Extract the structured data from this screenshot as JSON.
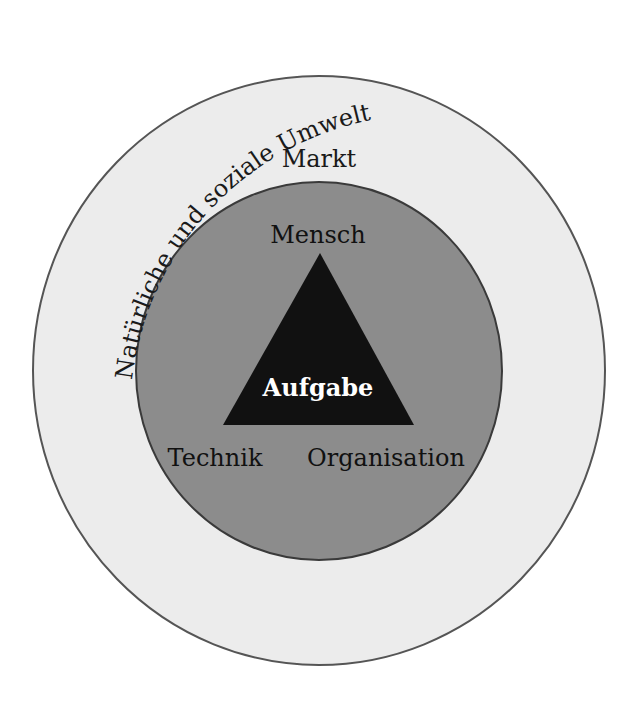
{
  "diagram": {
    "title": "Natürliche und soziale Umwelt",
    "layers": {
      "outer": {
        "label": "Markt",
        "fill": "#ececec",
        "stroke": "#555555"
      },
      "inner": {
        "label": "",
        "fill": "#8c8c8c",
        "stroke": "#3a3a3a"
      },
      "core": {
        "label": "Aufgabe",
        "fill": "#111111",
        "text_color": "#ffffff"
      }
    },
    "triangle_vertices": {
      "top": "Mensch",
      "bottom_left": "Technik",
      "bottom_right": "Organisation"
    }
  }
}
